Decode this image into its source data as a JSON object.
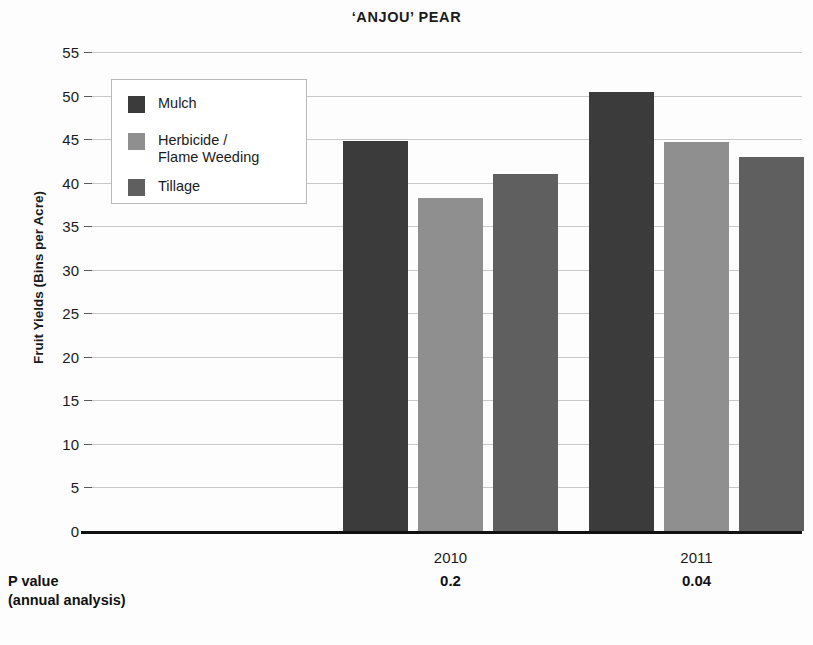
{
  "chart_data": {
    "type": "bar",
    "title": "‘ANJOU’ PEAR",
    "xlabel": "",
    "ylabel": "Fruit Yields (Bins per Acre)",
    "ylim": [
      0,
      55
    ],
    "yticks": [
      0,
      5,
      10,
      15,
      20,
      25,
      30,
      35,
      40,
      45,
      50,
      55
    ],
    "ytick_labels": [
      "0",
      "5",
      "10",
      "15",
      "20",
      "25",
      "30",
      "35",
      "40",
      "45",
      "50",
      "55"
    ],
    "categories": [
      "2010",
      "2011"
    ],
    "grid": true,
    "legend_position": "upper-left-inside",
    "series": [
      {
        "name": "Mulch",
        "color": "#3b3b3b",
        "values": [
          44.8,
          50.4
        ]
      },
      {
        "name": "Herbicide /\nFlame Weeding",
        "color": "#8f8f8f",
        "values": [
          38.2,
          44.7
        ]
      },
      {
        "name": "Tillage",
        "color": "#5f5f5f",
        "values": [
          41.0,
          42.9
        ]
      }
    ],
    "annotations": {
      "p_value_caption": "P value\n(annual analysis)",
      "p_values": [
        "0.2",
        "0.04"
      ]
    }
  },
  "axis": {
    "baseline_color": "#111111",
    "gridline_color": "#c9c9c9"
  }
}
